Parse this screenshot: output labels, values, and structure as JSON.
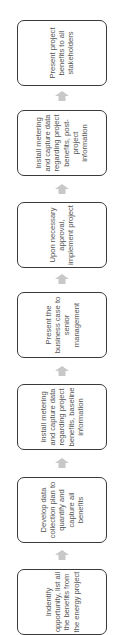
{
  "diagram": {
    "type": "process-flow",
    "direction": "bottom-to-top",
    "steps": [
      {
        "id": 1,
        "label": "Indentify opportunity, list all the benefits from the energy project"
      },
      {
        "id": 2,
        "label": "Develop data collection plan to quantify and capture all benefits"
      },
      {
        "id": 3,
        "label": "Install metering and capture data regarding project benefits, baseline information"
      },
      {
        "id": 4,
        "label": "Present the business case to senior management"
      },
      {
        "id": 5,
        "label": "Upon necessary approval, implement project"
      },
      {
        "id": 6,
        "label": "Install metering and capture data regarding project benefits, post-project information"
      },
      {
        "id": 7,
        "label": "Present project benefits to all stakeholders"
      }
    ],
    "colors": {
      "box_border": "#3a3a3a",
      "text": "#555555",
      "arrow": "#c8c8c8",
      "background": "#ffffff"
    }
  }
}
